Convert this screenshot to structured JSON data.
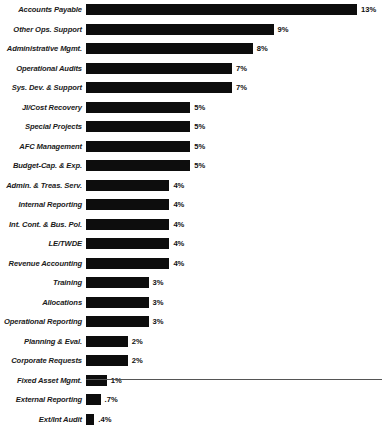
{
  "chart_data": {
    "type": "bar",
    "orientation": "horizontal",
    "title": "",
    "subtitle": "",
    "xlabel": "",
    "ylabel": "",
    "xlim": [
      0,
      13
    ],
    "grid": false,
    "legend": false,
    "axis_line": "bottom",
    "categories": [
      "Accounts Payable",
      "Other Ops. Support",
      "Administrative Mgmt.",
      "Operational Audits",
      "Sys. Dev. & Support",
      "JI/Cost Recovery",
      "Special Projects",
      "AFC Management",
      "Budget-Cap. & Exp.",
      "Admin. & Treas. Serv.",
      "Internal Reporting",
      "Int. Cont. & Bus. Pol.",
      "LE/TWDE",
      "Revenue Accounting",
      "Training",
      "Allocations",
      "Operational Reporting",
      "Planning & Eval.",
      "Corporate Requests",
      "Fixed Asset Mgmt.",
      "External Reporting",
      "Ext/Int Audit"
    ],
    "values": [
      13,
      9,
      8,
      7,
      7,
      5,
      5,
      5,
      5,
      4,
      4,
      4,
      4,
      4,
      3,
      3,
      3,
      2,
      2,
      1,
      0.7,
      0.4
    ],
    "value_labels": [
      "13%",
      "9%",
      "8%",
      "7%",
      "7%",
      "5%",
      "5%",
      "5%",
      "5%",
      "4%",
      "4%",
      "4%",
      "4%",
      "4%",
      "3%",
      "3%",
      "3%",
      "2%",
      "2%",
      "1%",
      ".7%",
      ".4%"
    ],
    "bar_color": "#0d0d0d"
  }
}
